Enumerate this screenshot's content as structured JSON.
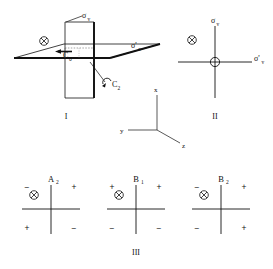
{
  "figure": {
    "caption_panels": [
      "I",
      "II",
      "III"
    ],
    "background_color": "#ffffff",
    "line_color": "#111111"
  },
  "panel_one": {
    "id": "I",
    "roman_label": "I",
    "description": "Perspective drawing of two perpendicular mirror planes intersecting a horizontal plane with a C2 rotation axis",
    "labels": {
      "sigma_v": "σ",
      "sigma_v_sub": "v",
      "sigma_v_prime": "σ'",
      "sigma_v_prime_sub": "v",
      "rotation_axis": "C",
      "rotation_axis_sub": "2",
      "center_label": "C",
      "center_label_sub": "0"
    },
    "icons": {
      "into_page": "circled-x-icon"
    }
  },
  "panel_two": {
    "id": "II",
    "roman_label": "II",
    "description": "Top-down projection showing the two mirror planes as crossed lines with the C2 axis out of the page at the origin",
    "labels": {
      "sigma_v": "σ",
      "sigma_v_sub": "v",
      "sigma_v_prime": "σ'",
      "sigma_v_prime_sub": "v"
    },
    "icons": {
      "into_page": "circled-x-icon",
      "out_of_page": "circled-plus-icon"
    }
  },
  "axes": {
    "description": "Coordinate axis triad",
    "x": "x",
    "y": "y",
    "z": "z"
  },
  "panel_three": {
    "id": "III",
    "roman_label": "III",
    "description": "Three nodal sign diagrams for irreducible representations",
    "diagrams": [
      {
        "term": "A",
        "term_sub": "2",
        "quadrant_signs": {
          "top_left": "−",
          "top_right": "+",
          "bottom_left": "+",
          "bottom_right": "−"
        },
        "icon": "circled-x-icon"
      },
      {
        "term": "B",
        "term_sub": "1",
        "quadrant_signs": {
          "top_left": "+",
          "top_right": "+",
          "bottom_left": "−",
          "bottom_right": "−"
        },
        "icon": "circled-x-icon"
      },
      {
        "term": "B",
        "term_sub": "2",
        "quadrant_signs": {
          "top_left": "−",
          "top_right": "+",
          "bottom_left": "−",
          "bottom_right": "+"
        },
        "icon": "circled-x-icon"
      }
    ]
  }
}
